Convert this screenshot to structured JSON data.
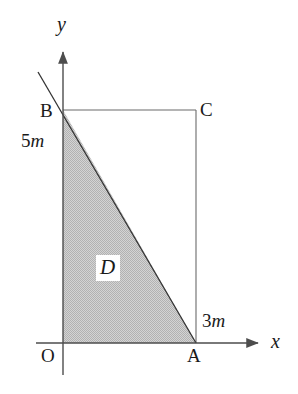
{
  "figure": {
    "background_color": "#ffffff",
    "line_color": "#4d4d4d",
    "shape_edge_color": "#2b2b2b",
    "shade_color": "#c8c8c8",
    "text_color": "#1a1a1a",
    "width": 298,
    "height": 394
  },
  "axes": {
    "x_label": "x",
    "y_label": "y",
    "origin_label": "O",
    "origin": {
      "x": 63,
      "y": 343
    },
    "x_axis": {
      "x_start": 36,
      "x_end": 262,
      "y": 343,
      "arrow": "right"
    },
    "y_axis": {
      "y_start": 48,
      "y_end": 375,
      "x": 63,
      "arrow": "up"
    }
  },
  "points": {
    "O": {
      "label": "O",
      "x": 63,
      "y": 343
    },
    "A": {
      "label": "A",
      "x": 196,
      "y": 343
    },
    "B": {
      "label": "B",
      "x": 63,
      "y": 110
    },
    "C": {
      "label": "C",
      "x": 196,
      "y": 110
    }
  },
  "measurements": {
    "height": {
      "value": "5",
      "unit": "m",
      "text": "5m",
      "edge": "OB"
    },
    "base": {
      "value": "3",
      "unit": "m",
      "text": "3m",
      "edge": "OA"
    }
  },
  "region": {
    "label": "D",
    "description": "shaded right triangle O-A-B",
    "fill": "#c8c8c8"
  },
  "rectangle": {
    "vertices": [
      "O",
      "A",
      "C",
      "B"
    ]
  },
  "hypotenuse": {
    "from": "B",
    "to": "A",
    "extension_point": {
      "x": 38,
      "y": 72
    }
  }
}
